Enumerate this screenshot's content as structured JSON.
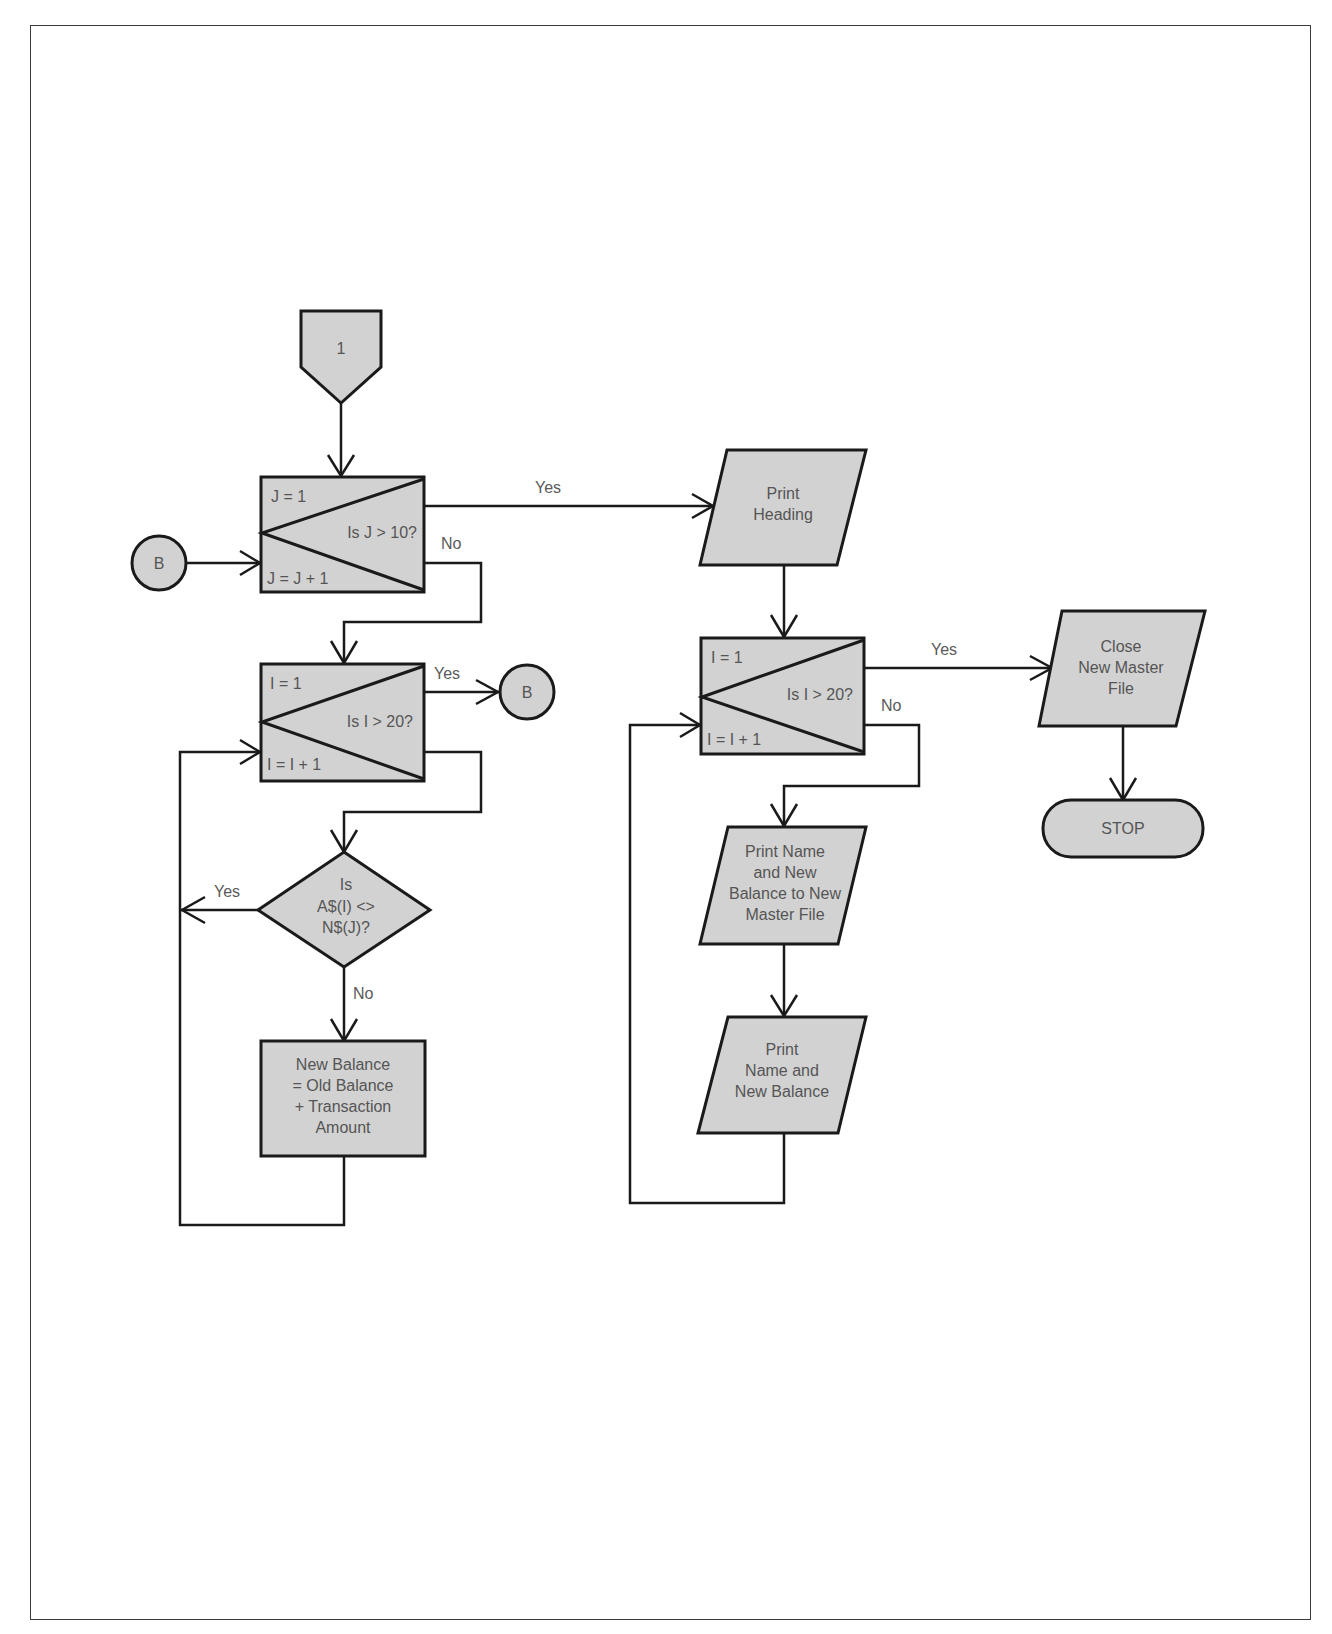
{
  "page": {
    "background": "#ffffff",
    "frame_color": "#3a3a3a",
    "shape_fill": "#d2d2d2",
    "stroke_color": "#1a1a1a",
    "text_color": "#555555"
  },
  "nodes": {
    "offpage_1": {
      "label": "1"
    },
    "connector_b_in": {
      "label": "B"
    },
    "loop_j": {
      "init": "J = 1",
      "test": "Is J > 10?",
      "incr": "J = J + 1"
    },
    "loop_i_left": {
      "init": "I = 1",
      "test": "Is I > 20?",
      "incr": "I = I + 1"
    },
    "connector_b_out": {
      "label": "B"
    },
    "decision_compare": {
      "lines": [
        "Is",
        "A$(I) <>",
        "N$(J)?"
      ]
    },
    "process_balance": {
      "lines": [
        "New Balance",
        "= Old Balance",
        "+ Transaction",
        "Amount"
      ]
    },
    "io_print_heading": {
      "lines": [
        "Print",
        "Heading"
      ]
    },
    "loop_i_right": {
      "init": "I = 1",
      "test": "Is I > 20?",
      "incr": "I = I + 1"
    },
    "io_print_to_master": {
      "lines": [
        "Print Name",
        "and New",
        "Balance to New",
        "Master File"
      ]
    },
    "io_print_name": {
      "lines": [
        "Print",
        "Name and",
        "New Balance"
      ]
    },
    "io_close_master": {
      "lines": [
        "Close",
        "New Master",
        "File"
      ]
    },
    "terminal_stop": {
      "label": "STOP"
    }
  },
  "edges": {
    "j_yes": "Yes",
    "j_no": "No",
    "i_left_yes": "Yes",
    "compare_yes": "Yes",
    "compare_no": "No",
    "i_right_yes": "Yes",
    "i_right_no": "No"
  }
}
